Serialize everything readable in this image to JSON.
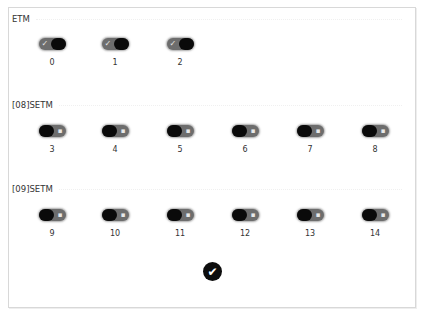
{
  "sections": [
    {
      "label": "ETM",
      "toggles": [
        {
          "label": "0",
          "state": "on"
        },
        {
          "label": "1",
          "state": "on"
        },
        {
          "label": "2",
          "state": "on"
        }
      ]
    },
    {
      "label": "[08]SETM",
      "toggles": [
        {
          "label": "3",
          "state": "off"
        },
        {
          "label": "4",
          "state": "off"
        },
        {
          "label": "5",
          "state": "off"
        },
        {
          "label": "6",
          "state": "off"
        },
        {
          "label": "7",
          "state": "off"
        },
        {
          "label": "8",
          "state": "off"
        }
      ]
    },
    {
      "label": "[09]SETM",
      "toggles": [
        {
          "label": "9",
          "state": "off"
        },
        {
          "label": "10",
          "state": "off"
        },
        {
          "label": "11",
          "state": "off"
        },
        {
          "label": "12",
          "state": "off"
        },
        {
          "label": "13",
          "state": "off"
        },
        {
          "label": "14",
          "state": "off"
        }
      ]
    }
  ],
  "icons": {
    "toggle_on_glyph": "✓",
    "toggle_off_glyph": "▪",
    "confirm_glyph": "✔"
  },
  "colors": {
    "toggle_track": "#6d6d6d",
    "toggle_knob": "#0a0a0a",
    "confirm_bg": "#0d0d0d",
    "panel_border": "#d8d8d8"
  }
}
